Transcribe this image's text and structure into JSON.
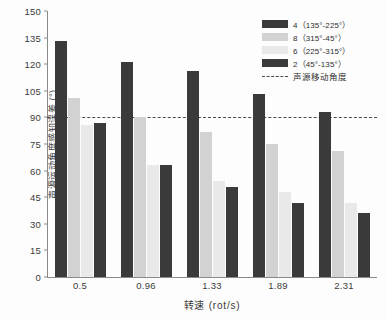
{
  "chart_data": {
    "type": "bar",
    "title": "",
    "xlabel": "转速 (rot/s)",
    "ylabel": "声源运动角度感知误差 (°)",
    "categories": [
      "0.5",
      "0.96",
      "1.33",
      "1.89",
      "2.31"
    ],
    "ylim": [
      0,
      150
    ],
    "yticks": [
      0,
      15,
      30,
      45,
      60,
      75,
      90,
      105,
      120,
      135,
      150
    ],
    "grid": false,
    "legend_position": "top-right",
    "series": [
      {
        "name": "4（135°-225°）",
        "color": "#3a3a3a",
        "values": [
          133,
          121,
          116,
          103,
          93
        ]
      },
      {
        "name": "8（315°-45°）",
        "color": "#d2d2d2",
        "values": [
          101,
          90,
          82,
          75,
          71
        ]
      },
      {
        "name": "6（225°-315°）",
        "color": "#e9e9e9",
        "values": [
          86,
          63,
          54,
          48,
          42
        ]
      },
      {
        "name": "2（45°-135°）",
        "color": "#3a3a3a",
        "values": [
          87,
          63,
          51,
          42,
          36
        ]
      }
    ],
    "reference_line": {
      "label": "声源移动角度",
      "value": 90,
      "style": "dashed",
      "color": "#4a4a4a"
    }
  },
  "axis": {
    "y_tick_labels": [
      "150",
      "135",
      "120",
      "105",
      "90",
      "75",
      "60",
      "45",
      "30",
      "15",
      "0"
    ],
    "y_title": "声源运动角度感知误差 (°)",
    "x_title": "转速 (rot/s)",
    "x_tick_labels": [
      "0.5",
      "0.96",
      "1.33",
      "1.89",
      "2.31"
    ]
  },
  "legend": {
    "entries": [
      {
        "label": "4（135°-225°）",
        "color": "#3a3a3a",
        "kind": "swatch"
      },
      {
        "label": "8（315°-45°）",
        "color": "#d2d2d2",
        "kind": "swatch"
      },
      {
        "label": "6（225°-315°）",
        "color": "#e9e9e9",
        "kind": "swatch"
      },
      {
        "label": "2（45°-135°）",
        "color": "#3a3a3a",
        "kind": "swatch"
      },
      {
        "label": "声源移动角度",
        "color": "#4a4a4a",
        "kind": "dash"
      }
    ]
  },
  "colors": {
    "series_dark": "#3a3a3a",
    "series_mid": "#d2d2d2",
    "series_light": "#e9e9e9",
    "reference": "#4a4a4a",
    "axis": "#8a8a8a",
    "background": "#fdfdfd",
    "text": "#3b3b3b"
  }
}
